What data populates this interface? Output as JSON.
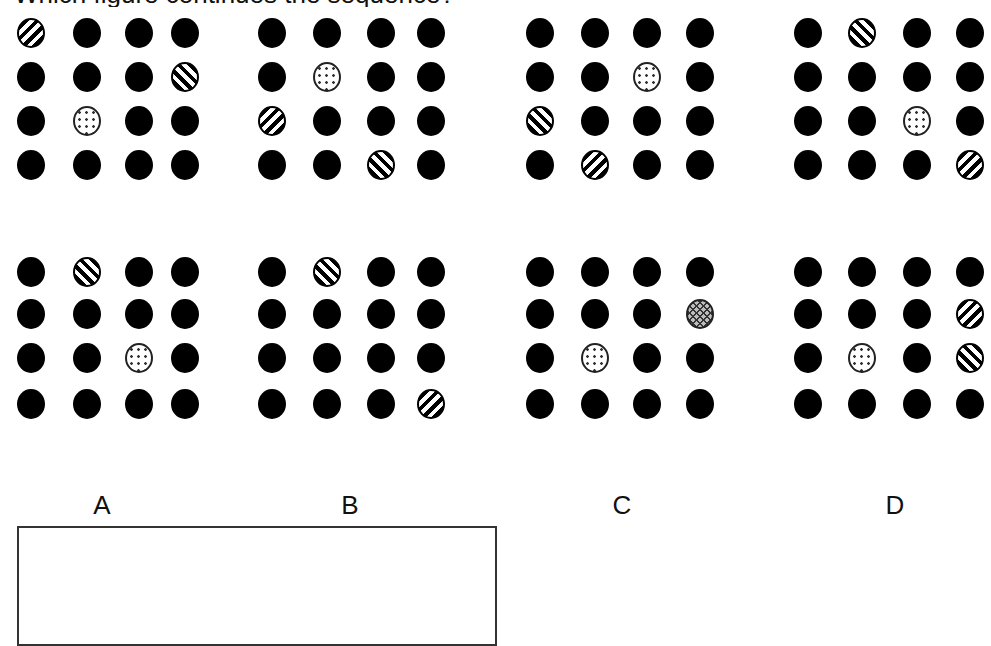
{
  "question": {
    "text": "Which figure continues the sequence?"
  },
  "legend": {
    "solid": "black filled circle",
    "fwd": "forward-diagonal striped circle",
    "back": "back-diagonal striped circle",
    "dotted": "dotted circle",
    "cross": "crosshatched circle"
  },
  "sequence": [
    {
      "id": "seq-1",
      "cells": [
        [
          "fwd",
          "solid",
          "solid",
          "solid"
        ],
        [
          "solid",
          "solid",
          "solid",
          "back"
        ],
        [
          "solid",
          "dotted",
          "solid",
          "solid"
        ],
        [
          "solid",
          "solid",
          "solid",
          "solid"
        ]
      ]
    },
    {
      "id": "seq-2",
      "cells": [
        [
          "solid",
          "solid",
          "solid",
          "solid"
        ],
        [
          "solid",
          "dotted",
          "solid",
          "solid"
        ],
        [
          "fwd",
          "solid",
          "solid",
          "solid"
        ],
        [
          "solid",
          "solid",
          "back",
          "solid"
        ]
      ]
    },
    {
      "id": "seq-3",
      "cells": [
        [
          "solid",
          "solid",
          "solid",
          "solid"
        ],
        [
          "solid",
          "solid",
          "dotted",
          "solid"
        ],
        [
          "back",
          "solid",
          "solid",
          "solid"
        ],
        [
          "solid",
          "fwd",
          "solid",
          "solid"
        ]
      ]
    },
    {
      "id": "seq-4",
      "cells": [
        [
          "solid",
          "back",
          "solid",
          "solid"
        ],
        [
          "solid",
          "solid",
          "solid",
          "solid"
        ],
        [
          "solid",
          "solid",
          "dotted",
          "solid"
        ],
        [
          "solid",
          "solid",
          "solid",
          "fwd"
        ]
      ]
    }
  ],
  "options": [
    {
      "label": "A",
      "cells": [
        [
          "solid",
          "back",
          "solid",
          "solid"
        ],
        [
          "solid",
          "solid",
          "solid",
          "solid"
        ],
        [
          "solid",
          "solid",
          "dotted",
          "solid"
        ],
        [
          "solid",
          "solid",
          "solid",
          "solid"
        ]
      ]
    },
    {
      "label": "B",
      "cells": [
        [
          "solid",
          "back",
          "solid",
          "solid"
        ],
        [
          "solid",
          "solid",
          "solid",
          "solid"
        ],
        [
          "solid",
          "solid",
          "solid",
          "solid"
        ],
        [
          "solid",
          "solid",
          "solid",
          "fwd"
        ]
      ]
    },
    {
      "label": "C",
      "cells": [
        [
          "solid",
          "solid",
          "solid",
          "solid"
        ],
        [
          "solid",
          "solid",
          "solid",
          "cross"
        ],
        [
          "solid",
          "dotted",
          "solid",
          "solid"
        ],
        [
          "solid",
          "solid",
          "solid",
          "solid"
        ]
      ]
    },
    {
      "label": "D",
      "cells": [
        [
          "solid",
          "solid",
          "solid",
          "solid"
        ],
        [
          "solid",
          "solid",
          "solid",
          "fwd"
        ],
        [
          "solid",
          "dotted",
          "solid",
          "back"
        ],
        [
          "solid",
          "solid",
          "solid",
          "solid"
        ]
      ]
    }
  ],
  "answer_box": {
    "value": ""
  }
}
